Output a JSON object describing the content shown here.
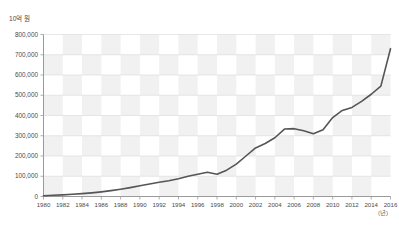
{
  "title": "",
  "y_axis_unit": "10억 원",
  "x_axis_unit": "(년)",
  "chart_data": {
    "type": "line",
    "title": "",
    "xlabel": "(년)",
    "ylabel": "10억 원",
    "xlim": [
      1980,
      2016
    ],
    "ylim": [
      0,
      800000
    ],
    "grid": true,
    "legend": "none",
    "background": "checkerboard",
    "x_tick_labels": [
      "1980",
      "1982",
      "1984",
      "1986",
      "1988",
      "1990",
      "1992",
      "1994",
      "1996",
      "1998",
      "2000",
      "2002",
      "2004",
      "2006",
      "2008",
      "2010",
      "2012",
      "2014",
      "2016"
    ],
    "y_tick_labels": [
      "0",
      "100,000",
      "200,000",
      "300,000",
      "400,000",
      "500,000",
      "600,000",
      "700,000",
      "800,000"
    ],
    "y_ticks": [
      0,
      100000,
      200000,
      300000,
      400000,
      500000,
      600000,
      700000,
      800000
    ],
    "series": [
      {
        "name": "총액",
        "color": "#555555",
        "x": [
          1980,
          1981,
          1982,
          1983,
          1984,
          1985,
          1986,
          1987,
          1988,
          1989,
          1990,
          1991,
          1992,
          1993,
          1994,
          1995,
          1996,
          1997,
          1998,
          1999,
          2000,
          2001,
          2002,
          2003,
          2004,
          2005,
          2006,
          2007,
          2008,
          2009,
          2010,
          2011,
          2012,
          2013,
          2014,
          2015,
          2016
        ],
        "values": [
          4000,
          6000,
          8000,
          11000,
          14000,
          18000,
          23000,
          29000,
          36000,
          44000,
          53000,
          62000,
          70000,
          78000,
          88000,
          100000,
          110000,
          120000,
          110000,
          130000,
          160000,
          200000,
          240000,
          262000,
          290000,
          333000,
          335000,
          325000,
          310000,
          330000,
          390000,
          425000,
          440000,
          470000,
          505000,
          545000,
          730000
        ]
      }
    ],
    "annotations": [
      {
        "label": "1997 peak",
        "x": 1997,
        "y": 120000
      },
      {
        "label": "1998 dip",
        "x": 1998,
        "y": 110000
      },
      {
        "label": "2006 plateau",
        "x": 2006,
        "y": 335000
      },
      {
        "label": "2008 trough",
        "x": 2008,
        "y": 310000
      },
      {
        "label": "2016 endpoint",
        "x": 2016,
        "y": 730000
      }
    ]
  }
}
